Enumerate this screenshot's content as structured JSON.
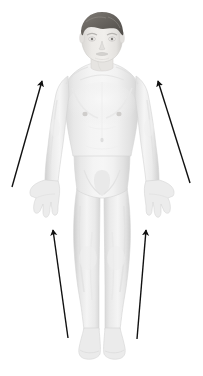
{
  "figure": {
    "caption": "Grayscale frontal full-body human figure with four black arrows indicating upward direction along the arms and legs",
    "background_color": "#ffffff",
    "canvas": {
      "width": 203,
      "height": 376
    }
  },
  "body": {
    "view": "anterior",
    "colors": {
      "skin_light": "#f2f2f2",
      "skin_mid": "#e4e4e4",
      "skin_shadow": "#d4d4d4",
      "skin_deep_shadow": "#c2c2c2",
      "outline": "#cfcfcf",
      "hair": "#6e6a66",
      "hair_shadow": "#55524f",
      "face": "#e8e6e3",
      "feature": "#b0aeab",
      "nipple": "#c9c7c4"
    },
    "parts": [
      {
        "name": "head",
        "label": "Head"
      },
      {
        "name": "hair",
        "label": "Hair"
      },
      {
        "name": "face",
        "label": "Face"
      },
      {
        "name": "neck",
        "label": "Neck"
      },
      {
        "name": "torso",
        "label": "Torso"
      },
      {
        "name": "left-arm",
        "label": "Left arm"
      },
      {
        "name": "right-arm",
        "label": "Right arm"
      },
      {
        "name": "left-hand",
        "label": "Left hand"
      },
      {
        "name": "right-hand",
        "label": "Right hand"
      },
      {
        "name": "pelvis",
        "label": "Pelvis"
      },
      {
        "name": "left-leg",
        "label": "Left leg"
      },
      {
        "name": "right-leg",
        "label": "Right leg"
      },
      {
        "name": "left-foot",
        "label": "Left foot"
      },
      {
        "name": "right-foot",
        "label": "Right foot"
      }
    ]
  },
  "arrows": {
    "color": "#111111",
    "stroke_width": 1.4,
    "items": [
      {
        "name": "arrow-upper-left",
        "label": "Upper left arrow",
        "direction": "up-right",
        "tail": {
          "x": 12,
          "y": 187
        },
        "tip": {
          "x": 42,
          "y": 81
        }
      },
      {
        "name": "arrow-upper-right",
        "label": "Upper right arrow",
        "direction": "up-left",
        "tail": {
          "x": 190,
          "y": 183
        },
        "tip": {
          "x": 158,
          "y": 81
        }
      },
      {
        "name": "arrow-lower-left",
        "label": "Lower left arrow",
        "direction": "up-left",
        "tail": {
          "x": 68,
          "y": 338
        },
        "tip": {
          "x": 53,
          "y": 230
        }
      },
      {
        "name": "arrow-lower-right",
        "label": "Lower right arrow",
        "direction": "up-right",
        "tail": {
          "x": 137,
          "y": 339
        },
        "tip": {
          "x": 146,
          "y": 230
        }
      }
    ]
  }
}
